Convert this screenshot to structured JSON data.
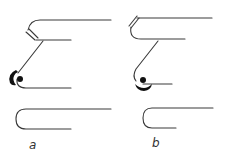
{
  "diagram": {
    "panels": [
      {
        "id": "a",
        "label": "a",
        "description": "Upper element with hatched pivot; diagonal arm ends in a large black crescent with dot at the left bend; separate U-shaped clip below"
      },
      {
        "id": "b",
        "label": "b",
        "description": "Upper element with hatched pivot at the top-left bend; diagonal arm descends to a lower bend with a dot and black crescent beneath; separate U-shaped clip below"
      }
    ],
    "colors": {
      "line": "#3a3a3a",
      "fill": "#111111",
      "background": "#ffffff"
    }
  }
}
